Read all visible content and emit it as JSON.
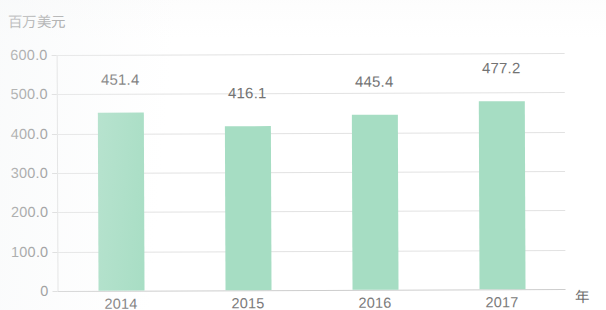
{
  "chart_data": {
    "type": "bar",
    "title": "",
    "subtitle": "",
    "xlabel": "年",
    "ylabel": "百万美元",
    "categories": [
      "2014",
      "2015",
      "2016",
      "2017"
    ],
    "values": [
      451.4,
      416.1,
      445.4,
      477.2
    ],
    "data_labels": [
      "451.4",
      "416.1",
      "445.4",
      "477.2"
    ],
    "ylim": [
      0,
      600
    ],
    "ytick_values": [
      0,
      100,
      200,
      300,
      400,
      500,
      600
    ],
    "ytick_labels": [
      "0",
      "100.0",
      "200.0",
      "300.0",
      "400.0",
      "500.0",
      "600.0"
    ],
    "xtick_labels": [
      "2014",
      "2015",
      "2016",
      "2017"
    ],
    "grid": true,
    "grid_axis": "y",
    "legend": false,
    "legend_position": "none",
    "series": [
      {
        "name": "百万美元",
        "values": [
          451.4,
          416.1,
          445.4,
          477.2
        ],
        "color": "#a6ddc3"
      }
    ],
    "colors": {
      "bar": "#a6ddc3",
      "gridline": "#e2e2e2",
      "axis": "#cdcdcd",
      "tick_text": "#777777",
      "label_text": "#737373",
      "background": "#ffffff"
    }
  }
}
